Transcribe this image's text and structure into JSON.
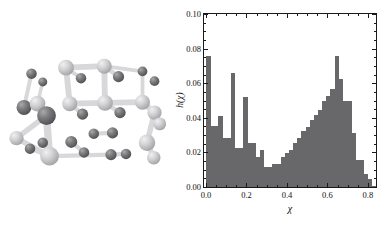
{
  "figure": {
    "panels": [
      "molecular-structure",
      "histogram"
    ],
    "background_color": "#ffffff"
  },
  "molecule": {
    "caption": "",
    "style": "ball-and-stick",
    "dark_atom_color": "#6e6e70",
    "light_atom_color": "#c9c9cb",
    "bond_color": "#d8d8da",
    "atoms": [
      {
        "x": 42,
        "y": 60,
        "r": 7.0,
        "shade": "dark"
      },
      {
        "x": 57,
        "y": 71,
        "r": 6.0,
        "shade": "dark"
      },
      {
        "x": 88,
        "y": 52,
        "r": 10.5,
        "shade": "light"
      },
      {
        "x": 108,
        "y": 66,
        "r": 7.0,
        "shade": "dark"
      },
      {
        "x": 139,
        "y": 50,
        "r": 10.0,
        "shade": "light"
      },
      {
        "x": 158,
        "y": 64,
        "r": 7.5,
        "shade": "dark"
      },
      {
        "x": 190,
        "y": 57,
        "r": 6.5,
        "shade": "dark"
      },
      {
        "x": 206,
        "y": 70,
        "r": 6.5,
        "shade": "dark"
      },
      {
        "x": 32,
        "y": 105,
        "r": 10.0,
        "shade": "dark"
      },
      {
        "x": 50,
        "y": 100,
        "r": 10.5,
        "shade": "light"
      },
      {
        "x": 62,
        "y": 116,
        "r": 12.5,
        "shade": "dark"
      },
      {
        "x": 93,
        "y": 100,
        "r": 10.0,
        "shade": "light"
      },
      {
        "x": 110,
        "y": 114,
        "r": 7.5,
        "shade": "dark"
      },
      {
        "x": 140,
        "y": 99,
        "r": 10.5,
        "shade": "light"
      },
      {
        "x": 160,
        "y": 112,
        "r": 7.5,
        "shade": "dark"
      },
      {
        "x": 190,
        "y": 98,
        "r": 10.0,
        "shade": "light"
      },
      {
        "x": 206,
        "y": 112,
        "r": 9.5,
        "shade": "light"
      },
      {
        "x": 213,
        "y": 127,
        "r": 8.5,
        "shade": "light"
      },
      {
        "x": 22,
        "y": 146,
        "r": 9.5,
        "shade": "light"
      },
      {
        "x": 40,
        "y": 160,
        "r": 7.0,
        "shade": "dark"
      },
      {
        "x": 57,
        "y": 152,
        "r": 7.0,
        "shade": "dark"
      },
      {
        "x": 66,
        "y": 170,
        "r": 12.5,
        "shade": "light"
      },
      {
        "x": 95,
        "y": 151,
        "r": 8.0,
        "shade": "dark"
      },
      {
        "x": 112,
        "y": 165,
        "r": 7.0,
        "shade": "dark"
      },
      {
        "x": 125,
        "y": 140,
        "r": 7.0,
        "shade": "dark"
      },
      {
        "x": 150,
        "y": 139,
        "r": 7.5,
        "shade": "dark"
      },
      {
        "x": 148,
        "y": 168,
        "r": 7.5,
        "shade": "dark"
      },
      {
        "x": 168,
        "y": 167,
        "r": 7.0,
        "shade": "dark"
      },
      {
        "x": 196,
        "y": 152,
        "r": 11.0,
        "shade": "light"
      },
      {
        "x": 205,
        "y": 172,
        "r": 9.0,
        "shade": "light"
      }
    ],
    "bonds": [
      [
        0,
        8
      ],
      [
        1,
        9
      ],
      [
        2,
        3
      ],
      [
        2,
        11
      ],
      [
        4,
        5
      ],
      [
        4,
        13
      ],
      [
        6,
        15
      ],
      [
        8,
        9
      ],
      [
        9,
        10
      ],
      [
        10,
        21
      ],
      [
        11,
        12
      ],
      [
        13,
        14
      ],
      [
        15,
        16
      ],
      [
        16,
        17
      ],
      [
        18,
        21
      ],
      [
        19,
        21
      ],
      [
        20,
        21
      ],
      [
        22,
        23
      ],
      [
        24,
        25
      ],
      [
        26,
        27
      ],
      [
        28,
        29
      ],
      [
        2,
        4
      ],
      [
        4,
        6
      ],
      [
        13,
        15
      ],
      [
        11,
        13
      ],
      [
        21,
        26
      ],
      [
        16,
        28
      ],
      [
        10,
        18
      ]
    ]
  },
  "chart_data": {
    "type": "bar",
    "title": "",
    "xlabel": "χ",
    "ylabel": "h(χ)",
    "xlim": [
      -0.01,
      0.84
    ],
    "ylim": [
      0.0,
      0.1
    ],
    "xticks": [
      0.0,
      0.2,
      0.4,
      0.6,
      0.8
    ],
    "xticklabels": [
      "0.0",
      "0.2",
      "0.4",
      "0.6",
      "0.8"
    ],
    "yticks": [
      0.0,
      0.02,
      0.04,
      0.06,
      0.08,
      0.1
    ],
    "yticklabels": [
      "0.00",
      "0.02",
      "0.04",
      "0.06",
      "0.08",
      "0.10"
    ],
    "grid": false,
    "legend": null,
    "bar_color": "#68686a",
    "bin_width": 0.0205,
    "bin_left_edges": [
      0.0,
      0.0205,
      0.041,
      0.0615,
      0.082,
      0.1025,
      0.123,
      0.1435,
      0.164,
      0.1845,
      0.205,
      0.2255,
      0.246,
      0.2665,
      0.287,
      0.3075,
      0.328,
      0.3485,
      0.369,
      0.3895,
      0.41,
      0.4305,
      0.451,
      0.4715,
      0.492,
      0.5125,
      0.533,
      0.5535,
      0.574,
      0.5945,
      0.615,
      0.6355,
      0.656,
      0.6765,
      0.697,
      0.7175,
      0.738,
      0.7585,
      0.779,
      0.7995,
      0.82
    ],
    "values": [
      0.076,
      0.0355,
      0.0355,
      0.041,
      0.0285,
      0.0285,
      0.066,
      0.0225,
      0.0225,
      0.052,
      0.0255,
      0.0255,
      0.0175,
      0.0215,
      0.0115,
      0.0115,
      0.0135,
      0.0135,
      0.0175,
      0.0195,
      0.0215,
      0.0255,
      0.0285,
      0.0325,
      0.0345,
      0.0385,
      0.0415,
      0.0445,
      0.0495,
      0.0525,
      0.0565,
      0.076,
      0.0625,
      0.0495,
      0.0495,
      0.0315,
      0.0155,
      0.0155,
      0.0075,
      0.0045,
      0.0005
    ]
  }
}
